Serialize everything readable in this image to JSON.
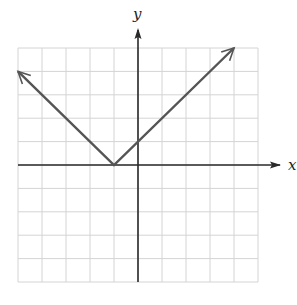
{
  "chart_data": {
    "type": "line",
    "title": "",
    "xlabel": "x",
    "ylabel": "y",
    "xlim": [
      -5,
      5
    ],
    "ylim": [
      -5,
      5
    ],
    "grid": true,
    "grid_step": 1,
    "tick_labels": false,
    "function": "y = |x + 1|",
    "vertex": [
      -1,
      0
    ],
    "series": [
      {
        "name": "y = |x + 1|",
        "x": [
          -5,
          -1,
          4
        ],
        "y": [
          4,
          0,
          5
        ],
        "arrows": [
          "start",
          "end"
        ]
      }
    ]
  },
  "colors": {
    "grid": "#d4d4d4",
    "axis": "#2a2a2a",
    "line": "#555555"
  }
}
